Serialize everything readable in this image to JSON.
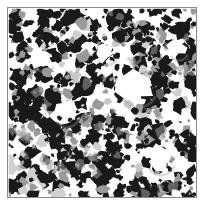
{
  "figure": {
    "kind": "micrograph",
    "caption": "",
    "title": "",
    "canvas": {
      "width": 204,
      "height": 207
    },
    "background_color": "#ffffff"
  },
  "frame": {
    "visible": true,
    "border_color": "#8a8a8a",
    "border_width_px": 1,
    "x": 7,
    "y": 7,
    "width": 190,
    "height": 191
  },
  "field": {
    "width": 188,
    "height": 189,
    "matrix_color": "#ffffff",
    "phase_dark_color": "#1a1a1a",
    "phase_mid_color": "#9a9a9a",
    "phase_light_color": "#d0d0d0"
  },
  "chart_data": {
    "type": "heatmap",
    "title": "",
    "xlabel": "",
    "ylabel": "",
    "grid": false,
    "legend": "none",
    "phases": [
      {
        "name": "dark phase (particles)",
        "color": "#1a1a1a",
        "area_fraction": 0.31
      },
      {
        "name": "gray phase (boundary / partial)",
        "color": "#9a9a9a",
        "area_fraction": 0.11
      },
      {
        "name": "white matrix (pores)",
        "color": "#ffffff",
        "area_fraction": 0.58
      }
    ],
    "texture_statistics": {
      "blob_count": 520,
      "blob_radius_min_px": 2.0,
      "blob_radius_max_px": 7.5,
      "cluster_count": 120,
      "random_seed": 20240517,
      "quadrant_gray_bias": {
        "upper_left": 0.18,
        "upper_right": 0.34,
        "lower_left": 0.36,
        "lower_right": 0.22
      },
      "quadrant_dark_density": {
        "upper_left": 1.0,
        "upper_right": 0.97,
        "lower_left": 1.04,
        "lower_right": 1.0
      },
      "void_regions": [
        {
          "cx": 128,
          "cy": 78,
          "r": 19
        },
        {
          "cx": 150,
          "cy": 150,
          "r": 15
        },
        {
          "cx": 56,
          "cy": 104,
          "r": 13
        },
        {
          "cx": 96,
          "cy": 44,
          "r": 11
        },
        {
          "cx": 34,
          "cy": 52,
          "r": 10
        },
        {
          "cx": 168,
          "cy": 40,
          "r": 10
        }
      ]
    }
  }
}
